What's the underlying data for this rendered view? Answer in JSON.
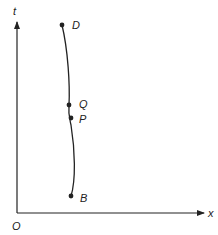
{
  "diagram": {
    "type": "spacetime-worldline",
    "axes": {
      "vertical_label": "t",
      "horizontal_label": "x",
      "origin_label": "O"
    },
    "points": [
      {
        "label": "D",
        "x": 62,
        "y": 25
      },
      {
        "label": "Q",
        "x": 69,
        "y": 105
      },
      {
        "label": "P",
        "x": 71,
        "y": 118
      },
      {
        "label": "B",
        "x": 71,
        "y": 196
      }
    ],
    "colors": {
      "stroke": "#222222",
      "background": "#ffffff"
    }
  }
}
